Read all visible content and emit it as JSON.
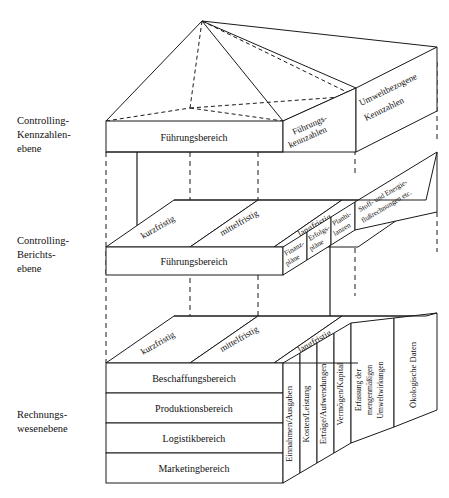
{
  "diagram": {
    "levels": [
      {
        "id": "kennzahlen",
        "label_lines": [
          "Controlling-",
          "Kennzahlen-",
          "ebene"
        ]
      },
      {
        "id": "berichte",
        "label_lines": [
          "Controlling-",
          "Berichts-",
          "ebene"
        ]
      },
      {
        "id": "rechnungswesen",
        "label_lines": [
          "Rechnungs-",
          "wesenebene"
        ]
      }
    ],
    "top_level": {
      "front_box_label": "Führungsbereich",
      "top_face_labels": [
        {
          "line1": "Führungs-",
          "line2": "kennzahlen"
        },
        {
          "line1": "Umweltbezogene",
          "line2": "Kennzahlen"
        }
      ]
    },
    "middle_level": {
      "front_box_label": "Führungsbereich",
      "horizon_labels": [
        "kurzfristig",
        "mittelfristig",
        "langfristig"
      ],
      "side_panels": [
        {
          "line1": "Finanz-",
          "line2": "pläne"
        },
        {
          "line1": "Erfolgs-",
          "line2": "pläne"
        },
        {
          "line1": "Planbi-",
          "line2": "lanzen"
        }
      ],
      "top_face_label": {
        "line1": "Stoff- und Energie-",
        "line2": "flußrechnungen etc."
      }
    },
    "bottom_level": {
      "rows": [
        "Beschaffungsbereich",
        "Produktionsbereich",
        "Logistikbereich",
        "Marketingbereich"
      ],
      "horizon_labels": [
        "kurzfristig",
        "mittelfristig",
        "langfristig"
      ],
      "side_panels": [
        {
          "lines": [
            "Einnahmen/Ausgaben"
          ]
        },
        {
          "lines": [
            "Kosten/Leistung"
          ]
        },
        {
          "lines": [
            "Erträge/Aufwendungen"
          ]
        },
        {
          "lines": [
            "Vermögen/Kapital"
          ]
        },
        {
          "lines": [
            "Erfassung der",
            "mengenmäßigen",
            "Umweltwirkungen"
          ]
        },
        {
          "lines": [
            "Ökologische Daten"
          ]
        }
      ]
    },
    "colors": {
      "stroke": "#1a1a1a",
      "fill": "#ffffff",
      "text": "#111111"
    }
  }
}
